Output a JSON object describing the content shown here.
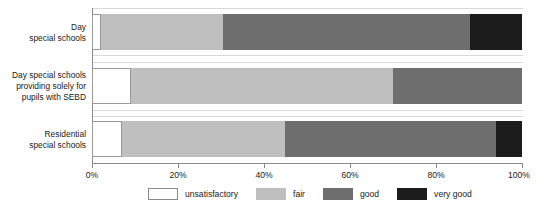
{
  "chart_data": {
    "type": "bar",
    "subtype": "stacked-horizontal-100pct",
    "title": "",
    "xlabel": "",
    "ylabel": "",
    "xlim": [
      0,
      100
    ],
    "x_tick_labels": [
      "0%",
      "20%",
      "40%",
      "60%",
      "80%",
      "100%"
    ],
    "x_ticks": [
      0,
      20,
      40,
      60,
      80,
      100
    ],
    "grid": false,
    "legend_position": "bottom",
    "categories": [
      "Day\nspecial schools",
      "Day special schools\nproviding solely for\npupils with SEBD",
      "Residential\nspecial schools"
    ],
    "series": [
      {
        "name": "unsatisfactory",
        "color": "#ffffff",
        "values": [
          2,
          9,
          7
        ]
      },
      {
        "name": "fair",
        "color": "#bfbfbf",
        "values": [
          28.5,
          61,
          38
        ]
      },
      {
        "name": "good",
        "color": "#6e6e6e",
        "values": [
          57.5,
          30,
          49
        ]
      },
      {
        "name": "very good",
        "color": "#1c1c1c",
        "values": [
          12,
          0,
          6
        ]
      }
    ]
  },
  "categories": [
    {
      "line1": "Day",
      "line2": "special schools",
      "line3": ""
    },
    {
      "line1": "Day special schools",
      "line2": "providing solely for",
      "line3": "pupils with SEBD"
    },
    {
      "line1": "Residential",
      "line2": "special schools",
      "line3": ""
    }
  ],
  "axis": {
    "ticks": [
      {
        "label": "0%",
        "value": 0
      },
      {
        "label": "20%",
        "value": 20
      },
      {
        "label": "40%",
        "value": 40
      },
      {
        "label": "60%",
        "value": 60
      },
      {
        "label": "80%",
        "value": 80
      },
      {
        "label": "100%",
        "value": 100
      }
    ]
  },
  "legend": {
    "items": [
      {
        "label": "unsatisfactory",
        "key": "unsatisfactory",
        "color": "#ffffff"
      },
      {
        "label": "fair",
        "key": "fair",
        "color": "#bfbfbf"
      },
      {
        "label": "good",
        "key": "good",
        "color": "#6e6e6e"
      },
      {
        "label": "very good",
        "key": "verygood",
        "color": "#1c1c1c"
      }
    ]
  },
  "geometry": {
    "plot_left": 92,
    "plot_right": 522,
    "bar_tops": [
      14,
      68,
      121
    ],
    "bar_height": 36,
    "gridline_tops": [
      8,
      55,
      62,
      110,
      116,
      163
    ]
  }
}
